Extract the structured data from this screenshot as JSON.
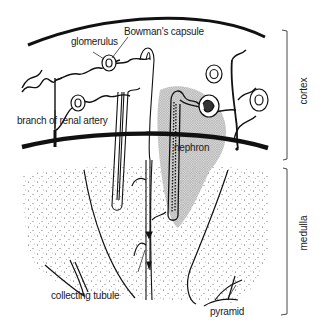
{
  "figure": {
    "type": "kidney-cross-section",
    "colors": {
      "ink": "#111111",
      "stipple": "#555555",
      "shade": "#9a9a9a",
      "background": "#ffffff"
    }
  },
  "labels": {
    "glomerulus": "glomerulus",
    "bowmans_capsule": "Bowman's capsule",
    "branch_of_renal_artery": "branch of renal artery",
    "nephron": "nephron",
    "collecting_tubule": "collecting tubule",
    "pyramid": "pyramid"
  },
  "regions": {
    "cortex": "cortex",
    "medulla": "medulla"
  }
}
